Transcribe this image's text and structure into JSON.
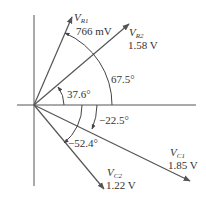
{
  "diagram": {
    "type": "phasor-diagram",
    "colors": {
      "axis": "#555555",
      "phasor": "#555555",
      "text": "#333333",
      "background": "#ffffff"
    },
    "phasors": [
      {
        "name": "V",
        "sub": "R1",
        "magnitude": "766 mV",
        "angle": "67.5°"
      },
      {
        "name": "V",
        "sub": "R2",
        "magnitude": "1.58 V",
        "angle": "37.6°"
      },
      {
        "name": "V",
        "sub": "C1",
        "magnitude": "1.85 V",
        "angle": "−22.5°"
      },
      {
        "name": "V",
        "sub": "C2",
        "magnitude": "1.22 V",
        "angle": "−52.4°"
      }
    ],
    "angle_labels": {
      "r1": "67.5°",
      "r2": "37.6°",
      "c1": "−22.5°",
      "c2": "−52.4°"
    }
  }
}
